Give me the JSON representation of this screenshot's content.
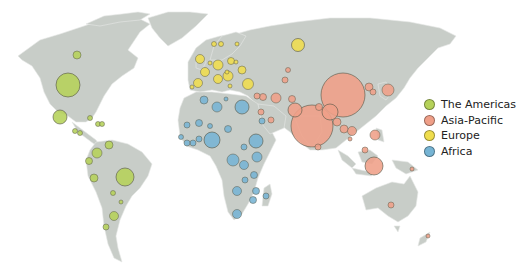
{
  "colors": {
    "land": "#c8cdc8",
    "border": "#e6e8e6",
    "the_americas": "#b5d159",
    "asia_pacific": "#ef9f88",
    "europe": "#efdd4d",
    "africa": "#76b4d4",
    "outline": "#5a5a4a"
  },
  "legend": {
    "items": [
      {
        "label": "The Americas",
        "color": "#b5d159"
      },
      {
        "label": "Asia-Pacific",
        "color": "#ef9f88"
      },
      {
        "label": "Europe",
        "color": "#efdd4d"
      },
      {
        "label": "Africa",
        "color": "#76b4d4"
      }
    ]
  },
  "bubbles": [
    {
      "region": "the_americas",
      "x": 77,
      "y": 55,
      "r": 4
    },
    {
      "region": "the_americas",
      "x": 68,
      "y": 85,
      "r": 12
    },
    {
      "region": "the_americas",
      "x": 60,
      "y": 117,
      "r": 7
    },
    {
      "region": "the_americas",
      "x": 90,
      "y": 118,
      "r": 2.5
    },
    {
      "region": "the_americas",
      "x": 98,
      "y": 124,
      "r": 2.5
    },
    {
      "region": "the_americas",
      "x": 102,
      "y": 124,
      "r": 2.5
    },
    {
      "region": "the_americas",
      "x": 75,
      "y": 131,
      "r": 2.5
    },
    {
      "region": "the_americas",
      "x": 80,
      "y": 133,
      "r": 2.5
    },
    {
      "region": "the_americas",
      "x": 109,
      "y": 145,
      "r": 4
    },
    {
      "region": "the_americas",
      "x": 97,
      "y": 153,
      "r": 5
    },
    {
      "region": "the_americas",
      "x": 89,
      "y": 161,
      "r": 3.5
    },
    {
      "region": "the_americas",
      "x": 94,
      "y": 178,
      "r": 4
    },
    {
      "region": "the_americas",
      "x": 125,
      "y": 177,
      "r": 9
    },
    {
      "region": "the_americas",
      "x": 113,
      "y": 193,
      "r": 2.5
    },
    {
      "region": "the_americas",
      "x": 121,
      "y": 202,
      "r": 2
    },
    {
      "region": "the_americas",
      "x": 114,
      "y": 216,
      "r": 4.5
    },
    {
      "region": "the_americas",
      "x": 106,
      "y": 227,
      "r": 3
    },
    {
      "region": "europe",
      "x": 200,
      "y": 59,
      "r": 4.5
    },
    {
      "region": "europe",
      "x": 218,
      "y": 65,
      "r": 5
    },
    {
      "region": "europe",
      "x": 205,
      "y": 72,
      "r": 4.5
    },
    {
      "region": "europe",
      "x": 228,
      "y": 76,
      "r": 5
    },
    {
      "region": "europe",
      "x": 198,
      "y": 83,
      "r": 4.5
    },
    {
      "region": "europe",
      "x": 218,
      "y": 79,
      "r": 4.5
    },
    {
      "region": "europe",
      "x": 248,
      "y": 84,
      "r": 5.5
    },
    {
      "region": "europe",
      "x": 242,
      "y": 70,
      "r": 4
    },
    {
      "region": "europe",
      "x": 231,
      "y": 61,
      "r": 3.5
    },
    {
      "region": "europe",
      "x": 298,
      "y": 45,
      "r": 6.5
    },
    {
      "region": "europe",
      "x": 214,
      "y": 44,
      "r": 2.5
    },
    {
      "region": "europe",
      "x": 221,
      "y": 44,
      "r": 2.5
    },
    {
      "region": "europe",
      "x": 237,
      "y": 44,
      "r": 2
    },
    {
      "region": "europe",
      "x": 236,
      "y": 62,
      "r": 2
    },
    {
      "region": "europe",
      "x": 227,
      "y": 72,
      "r": 2
    },
    {
      "region": "europe",
      "x": 210,
      "y": 63,
      "r": 2
    },
    {
      "region": "europe",
      "x": 192,
      "y": 87,
      "r": 2
    },
    {
      "region": "europe",
      "x": 230,
      "y": 86,
      "r": 2
    },
    {
      "region": "asia_pacific",
      "x": 257,
      "y": 96,
      "r": 3
    },
    {
      "region": "asia_pacific",
      "x": 263,
      "y": 97,
      "r": 3.5
    },
    {
      "region": "asia_pacific",
      "x": 276,
      "y": 98,
      "r": 5
    },
    {
      "region": "asia_pacific",
      "x": 288,
      "y": 70,
      "r": 2.5
    },
    {
      "region": "asia_pacific",
      "x": 285,
      "y": 80,
      "r": 3
    },
    {
      "region": "asia_pacific",
      "x": 292,
      "y": 99,
      "r": 3.5
    },
    {
      "region": "asia_pacific",
      "x": 295,
      "y": 110,
      "r": 7
    },
    {
      "region": "asia_pacific",
      "x": 261,
      "y": 112,
      "r": 3
    },
    {
      "region": "asia_pacific",
      "x": 271,
      "y": 120,
      "r": 3
    },
    {
      "region": "asia_pacific",
      "x": 343,
      "y": 95,
      "r": 22
    },
    {
      "region": "asia_pacific",
      "x": 312,
      "y": 126,
      "r": 21
    },
    {
      "region": "asia_pacific",
      "x": 330,
      "y": 112,
      "r": 8
    },
    {
      "region": "asia_pacific",
      "x": 319,
      "y": 107,
      "r": 3.5
    },
    {
      "region": "asia_pacific",
      "x": 337,
      "y": 122,
      "r": 4
    },
    {
      "region": "asia_pacific",
      "x": 369,
      "y": 87,
      "r": 4
    },
    {
      "region": "asia_pacific",
      "x": 373,
      "y": 92,
      "r": 3
    },
    {
      "region": "asia_pacific",
      "x": 388,
      "y": 90,
      "r": 6
    },
    {
      "region": "asia_pacific",
      "x": 344,
      "y": 129,
      "r": 4
    },
    {
      "region": "asia_pacific",
      "x": 352,
      "y": 131,
      "r": 4.5
    },
    {
      "region": "asia_pacific",
      "x": 350,
      "y": 139,
      "r": 2
    },
    {
      "region": "asia_pacific",
      "x": 375,
      "y": 135,
      "r": 5
    },
    {
      "region": "asia_pacific",
      "x": 365,
      "y": 150,
      "r": 3
    },
    {
      "region": "asia_pacific",
      "x": 374,
      "y": 166,
      "r": 9
    },
    {
      "region": "asia_pacific",
      "x": 318,
      "y": 147,
      "r": 3
    },
    {
      "region": "asia_pacific",
      "x": 391,
      "y": 205,
      "r": 3
    },
    {
      "region": "asia_pacific",
      "x": 412,
      "y": 169,
      "r": 2
    },
    {
      "region": "asia_pacific",
      "x": 428,
      "y": 236,
      "r": 2
    },
    {
      "region": "africa",
      "x": 204,
      "y": 100,
      "r": 4
    },
    {
      "region": "africa",
      "x": 217,
      "y": 107,
      "r": 5
    },
    {
      "region": "africa",
      "x": 242,
      "y": 107,
      "r": 7
    },
    {
      "region": "africa",
      "x": 226,
      "y": 99,
      "r": 2
    },
    {
      "region": "africa",
      "x": 187,
      "y": 125,
      "r": 3
    },
    {
      "region": "africa",
      "x": 199,
      "y": 123,
      "r": 3.5
    },
    {
      "region": "africa",
      "x": 212,
      "y": 140,
      "r": 8
    },
    {
      "region": "africa",
      "x": 228,
      "y": 129,
      "r": 3.5
    },
    {
      "region": "africa",
      "x": 199,
      "y": 139,
      "r": 3
    },
    {
      "region": "africa",
      "x": 193,
      "y": 143,
      "r": 3
    },
    {
      "region": "africa",
      "x": 187,
      "y": 143,
      "r": 3
    },
    {
      "region": "africa",
      "x": 256,
      "y": 141,
      "r": 7
    },
    {
      "region": "africa",
      "x": 262,
      "y": 121,
      "r": 3
    },
    {
      "region": "africa",
      "x": 233,
      "y": 160,
      "r": 6
    },
    {
      "region": "africa",
      "x": 244,
      "y": 165,
      "r": 4.5
    },
    {
      "region": "africa",
      "x": 257,
      "y": 157,
      "r": 5
    },
    {
      "region": "africa",
      "x": 254,
      "y": 175,
      "r": 3.5
    },
    {
      "region": "africa",
      "x": 237,
      "y": 191,
      "r": 4.5
    },
    {
      "region": "africa",
      "x": 245,
      "y": 180,
      "r": 3
    },
    {
      "region": "africa",
      "x": 256,
      "y": 191,
      "r": 3.5
    },
    {
      "region": "africa",
      "x": 253,
      "y": 200,
      "r": 3.5
    },
    {
      "region": "africa",
      "x": 266,
      "y": 196,
      "r": 3
    },
    {
      "region": "africa",
      "x": 237,
      "y": 214,
      "r": 4.5
    },
    {
      "region": "africa",
      "x": 244,
      "y": 147,
      "r": 3
    },
    {
      "region": "africa",
      "x": 210,
      "y": 126,
      "r": 2.5
    },
    {
      "region": "africa",
      "x": 181,
      "y": 137,
      "r": 2.5
    }
  ]
}
